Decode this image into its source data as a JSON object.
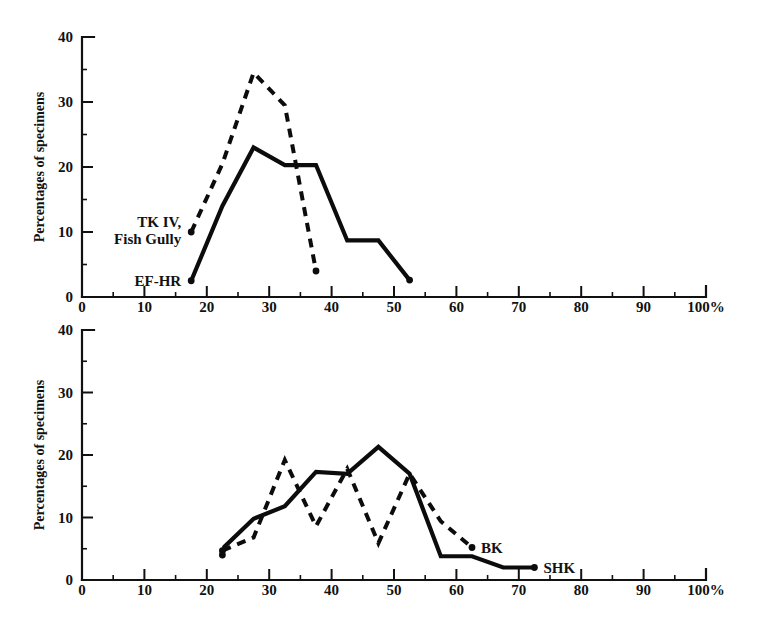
{
  "figure": {
    "background": "#ffffff",
    "ink_color": "#0c0c0c"
  },
  "chart_data": [
    {
      "id": "top",
      "type": "line",
      "title": "",
      "xlabel": "",
      "ylabel": "Percentages of specimens",
      "xlim": [
        0,
        100
      ],
      "ylim": [
        0,
        40
      ],
      "x_ticks": [
        0,
        10,
        20,
        30,
        40,
        50,
        60,
        70,
        80,
        90,
        100
      ],
      "x_tick_labels": [
        "0",
        "10",
        "20",
        "30",
        "40",
        "50",
        "60",
        "70",
        "80",
        "90",
        "100%"
      ],
      "x_minor_ticks": [
        5,
        15,
        25,
        35,
        45,
        55,
        65,
        75,
        85,
        95
      ],
      "y_ticks": [
        0,
        10,
        20,
        30,
        40
      ],
      "y_tick_labels": [
        "0",
        "10",
        "20",
        "30",
        "40"
      ],
      "y_minor_ticks": [
        5,
        15,
        25,
        35
      ],
      "grid": false,
      "legend": "inline-labels",
      "series": [
        {
          "name": "TK IV, Fish Gully",
          "style": "dashed",
          "label_position": "left-inline",
          "points": [
            {
              "x": 17.5,
              "y": 10.0
            },
            {
              "x": 22.5,
              "y": 20.5
            },
            {
              "x": 27.5,
              "y": 34.5
            },
            {
              "x": 32.5,
              "y": 29.5
            },
            {
              "x": 37.5,
              "y": 4.0
            }
          ]
        },
        {
          "name": "EF-HR",
          "style": "solid",
          "label_position": "left-inline",
          "points": [
            {
              "x": 17.5,
              "y": 2.5
            },
            {
              "x": 22.5,
              "y": 14.0
            },
            {
              "x": 27.5,
              "y": 23.0
            },
            {
              "x": 32.5,
              "y": 20.3
            },
            {
              "x": 37.5,
              "y": 20.3
            },
            {
              "x": 42.5,
              "y": 8.7
            },
            {
              "x": 47.5,
              "y": 8.7
            },
            {
              "x": 52.5,
              "y": 2.6
            }
          ]
        }
      ]
    },
    {
      "id": "bottom",
      "type": "line",
      "title": "",
      "xlabel": "",
      "ylabel": "Percentages of specimens",
      "xlim": [
        0,
        100
      ],
      "ylim": [
        0,
        40
      ],
      "x_ticks": [
        0,
        10,
        20,
        30,
        40,
        50,
        60,
        70,
        80,
        90,
        100
      ],
      "x_tick_labels": [
        "0",
        "10",
        "20",
        "30",
        "40",
        "50",
        "60",
        "70",
        "80",
        "90",
        "100%"
      ],
      "x_minor_ticks": [
        5,
        15,
        25,
        35,
        45,
        55,
        65,
        75,
        85,
        95
      ],
      "y_ticks": [
        0,
        10,
        20,
        30,
        40
      ],
      "y_tick_labels": [
        "0",
        "10",
        "20",
        "30",
        "40"
      ],
      "y_minor_ticks": [
        5,
        15,
        25,
        35
      ],
      "grid": false,
      "legend": "inline-labels",
      "series": [
        {
          "name": "BK",
          "style": "dashed",
          "label_position": "right-end",
          "points": [
            {
              "x": 22.5,
              "y": 4.7
            },
            {
              "x": 27.5,
              "y": 6.8
            },
            {
              "x": 32.5,
              "y": 19.2
            },
            {
              "x": 37.5,
              "y": 8.6
            },
            {
              "x": 42.5,
              "y": 17.8
            },
            {
              "x": 47.5,
              "y": 5.9
            },
            {
              "x": 52.5,
              "y": 17.0
            },
            {
              "x": 57.5,
              "y": 9.4
            },
            {
              "x": 62.5,
              "y": 5.2
            }
          ]
        },
        {
          "name": "SHK",
          "style": "solid",
          "label_position": "right-end",
          "points": [
            {
              "x": 22.5,
              "y": 4.0
            },
            {
              "x": 22.8,
              "y": 5.3
            },
            {
              "x": 27.5,
              "y": 9.8
            },
            {
              "x": 32.5,
              "y": 11.8
            },
            {
              "x": 37.5,
              "y": 17.3
            },
            {
              "x": 42.5,
              "y": 17.0
            },
            {
              "x": 47.5,
              "y": 21.3
            },
            {
              "x": 52.5,
              "y": 17.0
            },
            {
              "x": 57.5,
              "y": 3.8
            },
            {
              "x": 62.5,
              "y": 3.8
            },
            {
              "x": 67.5,
              "y": 2.0
            },
            {
              "x": 72.5,
              "y": 2.0
            }
          ]
        }
      ]
    }
  ]
}
